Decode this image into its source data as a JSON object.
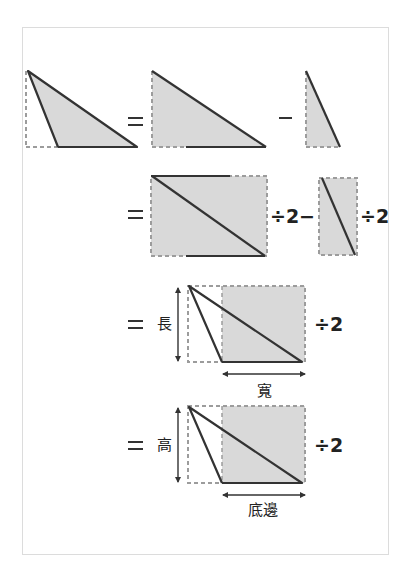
{
  "colors": {
    "fill": "#d9d9d9",
    "dashed": "#9c9c9c",
    "solid": "#333333",
    "frame": "#dcdcdc"
  },
  "row2": {
    "div1": "÷2",
    "minus": "−",
    "div2": "÷2"
  },
  "row3": {
    "height_label": "長",
    "width_label": "寬",
    "div": "÷2"
  },
  "row4": {
    "height_label": "高",
    "width_label": "底邊",
    "div": "÷2"
  }
}
